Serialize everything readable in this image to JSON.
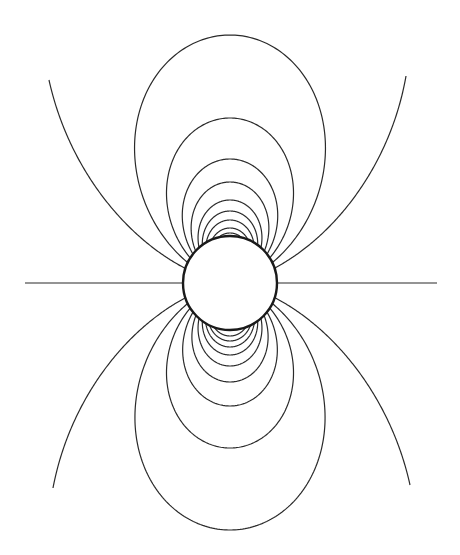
{
  "diagram": {
    "type": "dipole-field-lines",
    "background": "#ffffff",
    "stroke_color": "#2a2a2a",
    "center": {
      "x": 230,
      "y": 283
    },
    "sphere_radius": 47,
    "top_loop_lengths": [
      248,
      165,
      124,
      101,
      83,
      72,
      63,
      55,
      50
    ],
    "bottom_loop_lengths": [
      247,
      165,
      123,
      99,
      83,
      72,
      64,
      58,
      53
    ],
    "open_lines": [
      {
        "side": "upper-left",
        "end": {
          "x": 49,
          "y": 80
        }
      },
      {
        "side": "upper-right",
        "end": {
          "x": 406,
          "y": 76
        }
      },
      {
        "side": "lower-left",
        "end": {
          "x": 53,
          "y": 488
        }
      },
      {
        "side": "lower-right",
        "end": {
          "x": 410,
          "y": 485
        }
      }
    ],
    "equator_lines": [
      {
        "side": "left",
        "x_end": 25
      },
      {
        "side": "right",
        "x_end": 437
      }
    ]
  }
}
